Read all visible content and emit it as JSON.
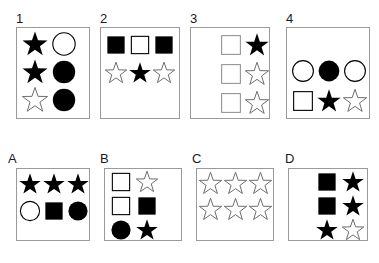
{
  "figure": {
    "background_color": "#ffffff",
    "box_border_color": "#9a9a9a",
    "filled_color": "#000000",
    "outline_color": "#000000",
    "light_outline_color": "#6e6e6e"
  },
  "panels": [
    {
      "id": "panel-1",
      "label": "1",
      "columns": 2,
      "rows": 3,
      "box": {
        "x": 16,
        "y": 27,
        "w": 74,
        "h": 92
      },
      "label_pos": {
        "x": 16,
        "y": 12
      },
      "content_pos": {
        "x": 20,
        "y": 30,
        "w": 58,
        "h": 84
      },
      "cell_size": 28,
      "cells": [
        {
          "shape": "star",
          "fill": "filled"
        },
        {
          "shape": "circle",
          "fill": "outline"
        },
        {
          "shape": "star",
          "fill": "filled"
        },
        {
          "shape": "circle",
          "fill": "filled"
        },
        {
          "shape": "star",
          "fill": "outline-light"
        },
        {
          "shape": "circle",
          "fill": "filled"
        }
      ]
    },
    {
      "id": "panel-2",
      "label": "2",
      "columns": 3,
      "rows": 2,
      "box": {
        "x": 100,
        "y": 27,
        "w": 80,
        "h": 92
      },
      "label_pos": {
        "x": 100,
        "y": 12
      },
      "content_pos": {
        "x": 104,
        "y": 31,
        "w": 72,
        "h": 56
      },
      "cell_size": 24,
      "cells": [
        {
          "shape": "square",
          "fill": "filled"
        },
        {
          "shape": "square",
          "fill": "outline"
        },
        {
          "shape": "square",
          "fill": "filled"
        },
        {
          "shape": "star",
          "fill": "outline-light"
        },
        {
          "shape": "star",
          "fill": "filled"
        },
        {
          "shape": "star",
          "fill": "outline-light"
        }
      ]
    },
    {
      "id": "panel-3",
      "label": "3",
      "columns": 2,
      "rows": 3,
      "box": {
        "x": 190,
        "y": 27,
        "w": 80,
        "h": 92
      },
      "label_pos": {
        "x": 190,
        "y": 12
      },
      "content_pos": {
        "x": 218,
        "y": 31,
        "w": 52,
        "h": 86
      },
      "cell_size": 26,
      "cells": [
        {
          "shape": "square",
          "fill": "outline-gray"
        },
        {
          "shape": "star",
          "fill": "filled"
        },
        {
          "shape": "square",
          "fill": "outline-gray"
        },
        {
          "shape": "star",
          "fill": "outline-light"
        },
        {
          "shape": "square",
          "fill": "outline-gray"
        },
        {
          "shape": "star",
          "fill": "outline-light"
        }
      ]
    },
    {
      "id": "panel-4",
      "label": "4",
      "columns": 3,
      "rows": 2,
      "box": {
        "x": 286,
        "y": 27,
        "w": 84,
        "h": 92
      },
      "label_pos": {
        "x": 286,
        "y": 12
      },
      "content_pos": {
        "x": 290,
        "y": 56,
        "w": 78,
        "h": 60
      },
      "cell_size": 26,
      "cells": [
        {
          "shape": "circle",
          "fill": "outline"
        },
        {
          "shape": "circle",
          "fill": "filled"
        },
        {
          "shape": "circle",
          "fill": "outline"
        },
        {
          "shape": "square",
          "fill": "outline"
        },
        {
          "shape": "star",
          "fill": "filled"
        },
        {
          "shape": "star",
          "fill": "outline-light"
        }
      ]
    },
    {
      "id": "panel-A",
      "label": "A",
      "columns": 3,
      "rows": 2,
      "box": {
        "x": 16,
        "y": 168,
        "w": 74,
        "h": 73
      },
      "label_pos": {
        "x": 8,
        "y": 152
      },
      "content_pos": {
        "x": 18,
        "y": 170,
        "w": 70,
        "h": 54
      },
      "cell_size": 24,
      "cells": [
        {
          "shape": "star",
          "fill": "filled"
        },
        {
          "shape": "star",
          "fill": "filled"
        },
        {
          "shape": "star",
          "fill": "filled"
        },
        {
          "shape": "circle",
          "fill": "outline"
        },
        {
          "shape": "square",
          "fill": "filled"
        },
        {
          "shape": "circle",
          "fill": "filled"
        }
      ]
    },
    {
      "id": "panel-B",
      "label": "B",
      "columns": 2,
      "rows": 3,
      "box": {
        "x": 104,
        "y": 168,
        "w": 78,
        "h": 73
      },
      "label_pos": {
        "x": 100,
        "y": 152
      },
      "content_pos": {
        "x": 108,
        "y": 170,
        "w": 52,
        "h": 70
      },
      "cell_size": 24,
      "cells": [
        {
          "shape": "square",
          "fill": "outline"
        },
        {
          "shape": "star",
          "fill": "outline-light"
        },
        {
          "shape": "square",
          "fill": "outline"
        },
        {
          "shape": "square",
          "fill": "filled"
        },
        {
          "shape": "circle",
          "fill": "filled"
        },
        {
          "shape": "star",
          "fill": "filled"
        }
      ]
    },
    {
      "id": "panel-C",
      "label": "C",
      "columns": 3,
      "rows": 2,
      "box": {
        "x": 196,
        "y": 168,
        "w": 78,
        "h": 73
      },
      "label_pos": {
        "x": 192,
        "y": 152
      },
      "content_pos": {
        "x": 198,
        "y": 170,
        "w": 74,
        "h": 52
      },
      "cell_size": 25,
      "cells": [
        {
          "shape": "star",
          "fill": "outline-light"
        },
        {
          "shape": "star",
          "fill": "outline-light"
        },
        {
          "shape": "star",
          "fill": "outline-light"
        },
        {
          "shape": "star",
          "fill": "outline-light"
        },
        {
          "shape": "star",
          "fill": "outline-light"
        },
        {
          "shape": "star",
          "fill": "outline-light"
        }
      ]
    },
    {
      "id": "panel-D",
      "label": "D",
      "columns": 2,
      "rows": 3,
      "box": {
        "x": 288,
        "y": 168,
        "w": 80,
        "h": 73
      },
      "label_pos": {
        "x": 285,
        "y": 152
      },
      "content_pos": {
        "x": 314,
        "y": 170,
        "w": 52,
        "h": 70
      },
      "cell_size": 24,
      "cells": [
        {
          "shape": "square",
          "fill": "filled"
        },
        {
          "shape": "star",
          "fill": "filled"
        },
        {
          "shape": "square",
          "fill": "filled"
        },
        {
          "shape": "star",
          "fill": "filled"
        },
        {
          "shape": "star",
          "fill": "filled"
        },
        {
          "shape": "star",
          "fill": "outline-light"
        }
      ]
    }
  ]
}
